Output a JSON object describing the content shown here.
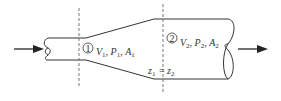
{
  "diagram": {
    "type": "pipe-expansion-flow",
    "section1": {
      "marker": "①",
      "label": "V₁, P₁, A₁",
      "parts": [
        {
          "v": "V",
          "s": "1"
        },
        {
          "v": "P",
          "s": "1"
        },
        {
          "v": "A",
          "s": "1"
        }
      ]
    },
    "section2": {
      "marker": "②",
      "label": "V₂, P₂, A₂",
      "parts": [
        {
          "v": "V",
          "s": "2"
        },
        {
          "v": "P",
          "s": "2"
        },
        {
          "v": "A",
          "s": "2"
        }
      ]
    },
    "elevation": {
      "label": "z₁ = z₂",
      "left": {
        "v": "z",
        "s": "1"
      },
      "eq": "=",
      "right": {
        "v": "z",
        "s": "2"
      }
    },
    "flow_in": "inlet-arrow",
    "flow_out": "outlet-arrow",
    "colors": {
      "line": "#333333",
      "dashed": "#777777"
    }
  }
}
